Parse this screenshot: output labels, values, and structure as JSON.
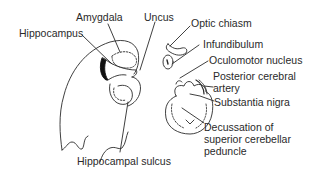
{
  "diagram": {
    "type": "anatomical-illustration",
    "colors": {
      "line": "#2a2a2a",
      "background": "#ffffff",
      "fill_dark": "#111111"
    },
    "labels": {
      "amygdala": "Amygdala",
      "uncus": "Uncus",
      "hippocampus": "Hippocampus",
      "optic_chiasm": "Optic chiasm",
      "infundibulum": "Infundibulum",
      "oculomotor_nucleus": "Oculomotor nucleus",
      "posterior_cerebral_artery_1": "Posterior cerebral",
      "posterior_cerebral_artery_2": "artery",
      "substantia_nigra": "Substantia nigra",
      "decussation_1": "Decussation of",
      "decussation_2": "superior cerebellar",
      "decussation_3": "peduncle",
      "hippocampal_sulcus": "Hippocampal sulcus"
    }
  }
}
